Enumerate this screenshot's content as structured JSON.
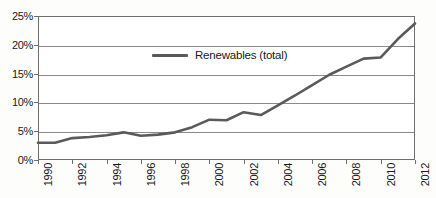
{
  "chart_data": {
    "type": "line",
    "title": "",
    "xlabel": "",
    "ylabel": "",
    "x": [
      1990,
      1991,
      1992,
      1993,
      1994,
      1995,
      1996,
      1997,
      1998,
      1999,
      2000,
      2001,
      2002,
      2003,
      2004,
      2005,
      2006,
      2007,
      2008,
      2009,
      2010,
      2011,
      2012
    ],
    "series": [
      {
        "name": "Renewables (total)",
        "color": "#5a5a5a",
        "values": [
          3.0,
          3.0,
          3.8,
          4.0,
          4.3,
          4.8,
          4.2,
          4.4,
          4.8,
          5.7,
          7.0,
          6.9,
          8.3,
          7.8,
          9.5,
          11.2,
          13.0,
          14.8,
          16.2,
          17.6,
          17.8,
          21.0,
          23.7
        ]
      }
    ],
    "xlim": [
      1990,
      2012
    ],
    "ylim": [
      0,
      25
    ],
    "ytick_values": [
      0,
      5,
      10,
      15,
      20,
      25
    ],
    "ytick_labels": [
      "0%",
      "5%",
      "10%",
      "15%",
      "20%",
      "25%"
    ],
    "xtick_values": [
      1990,
      1992,
      1994,
      1996,
      1998,
      2000,
      2002,
      2004,
      2006,
      2008,
      2010,
      2012
    ],
    "xtick_labels": [
      "1990",
      "1992",
      "1994",
      "1996",
      "1998",
      "2000",
      "2002",
      "2004",
      "2006",
      "2008",
      "2010",
      "2012"
    ],
    "grid": true,
    "grid_axis": "y",
    "legend_position": "inside-top-center",
    "value_unit": "%",
    "xtick_rotation": -90
  },
  "legend": {
    "entries": [
      {
        "label": "Renewables (total)",
        "color": "#5a5a5a"
      }
    ]
  },
  "axis_colors": {
    "frame": "#6e6e6e",
    "grid": "#8a8a8a",
    "text": "#1a1a1a"
  }
}
